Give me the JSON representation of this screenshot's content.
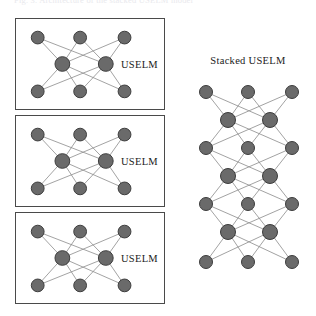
{
  "figure": {
    "clipped_top_caption": "Fig. 3.  Architecture of the stacked USELM model",
    "background_color": "#ffffff",
    "node_fill_color": "#6a6a6a",
    "node_stroke_color": "#3c3c3c",
    "edge_color": "#8a8a8a",
    "box_border_color": "#4a4a4a",
    "text_color": "#1a1a1a"
  },
  "left_column": {
    "blocks": [
      {
        "label": "USELM",
        "network": {
          "layers": [
            3,
            2,
            3
          ],
          "fully_connected": true
        }
      },
      {
        "label": "USELM",
        "network": {
          "layers": [
            3,
            2,
            3
          ],
          "fully_connected": true
        }
      },
      {
        "label": "USELM",
        "network": {
          "layers": [
            3,
            2,
            3
          ],
          "fully_connected": true
        }
      }
    ]
  },
  "right_column": {
    "title": "Stacked USELM",
    "network": {
      "layers": [
        3,
        2,
        3,
        2,
        3,
        2,
        3
      ],
      "layer_count": 7,
      "fully_connected": true
    }
  }
}
